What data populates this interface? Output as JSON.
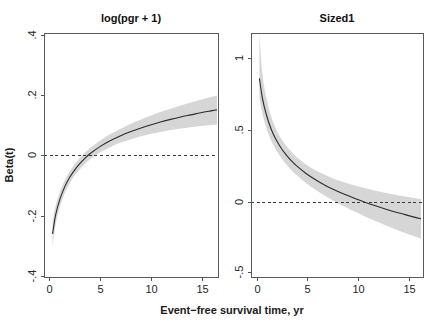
{
  "figure": {
    "xlabel": "Event−free survival time, yr",
    "ylabel": "Beta(t)",
    "background": "#ffffff",
    "band_color": "#d6d6d6",
    "line_color": "#2b2b2b",
    "zero_line_color": "#3a3a3a"
  },
  "chart_data": [
    {
      "type": "line",
      "title": "log(pgr + 1)",
      "xlabel": "Event−free survival time, yr",
      "ylabel": "Beta(t)",
      "xlim": [
        -0.55,
        16.8
      ],
      "ylim": [
        -0.46,
        0.455
      ],
      "xticks": [
        0,
        5,
        10,
        15
      ],
      "xticklabels": [
        "0",
        "5",
        "10",
        "15"
      ],
      "yticks": [
        0.4,
        0.2,
        0,
        -0.2,
        -0.4
      ],
      "yticklabels": [
        ".4",
        ".2",
        "0",
        "-.2",
        "-.4"
      ],
      "grid": false,
      "legend": null,
      "reference_line": {
        "y": 0,
        "style": "dashed"
      },
      "x": [
        0.3,
        0.6,
        1.0,
        1.5,
        2.0,
        2.5,
        3.0,
        3.5,
        4.0,
        5.0,
        6.0,
        7.0,
        8.0,
        9.0,
        10.0,
        11.0,
        12.0,
        13.0,
        14.0,
        15.0,
        16.0,
        16.6
      ],
      "series": [
        {
          "name": "fit",
          "values": [
            -0.298,
            -0.228,
            -0.172,
            -0.122,
            -0.086,
            -0.058,
            -0.035,
            -0.015,
            0.002,
            0.029,
            0.051,
            0.069,
            0.085,
            0.098,
            0.11,
            0.121,
            0.131,
            0.14,
            0.148,
            0.156,
            0.163,
            0.167
          ]
        },
        {
          "name": "ci_lower",
          "values": [
            -0.345,
            -0.263,
            -0.2,
            -0.146,
            -0.108,
            -0.079,
            -0.056,
            -0.036,
            -0.019,
            0.007,
            0.027,
            0.043,
            0.056,
            0.067,
            0.076,
            0.084,
            0.091,
            0.097,
            0.102,
            0.106,
            0.11,
            0.112
          ]
        },
        {
          "name": "ci_upper",
          "values": [
            -0.251,
            -0.193,
            -0.144,
            -0.098,
            -0.064,
            -0.037,
            -0.014,
            0.006,
            0.023,
            0.051,
            0.075,
            0.095,
            0.114,
            0.13,
            0.145,
            0.159,
            0.171,
            0.183,
            0.194,
            0.205,
            0.215,
            0.221
          ]
        }
      ]
    },
    {
      "type": "line",
      "title": "Sized1",
      "xlabel": "Event−free survival time, yr",
      "ylabel": "Beta(t)",
      "xlim": [
        -0.55,
        16.8
      ],
      "ylim": [
        -0.62,
        1.18
      ],
      "xticks": [
        0,
        5,
        10,
        15
      ],
      "xticklabels": [
        "0",
        "5",
        "10",
        "15"
      ],
      "yticks": [
        1,
        0.5,
        0,
        -0.5
      ],
      "yticklabels": [
        "1",
        ".5",
        "0",
        "-.5"
      ],
      "grid": false,
      "legend": null,
      "reference_line": {
        "y": 0,
        "style": "dashed"
      },
      "x": [
        0.3,
        0.6,
        1.0,
        1.5,
        2.0,
        2.5,
        3.0,
        3.5,
        4.0,
        5.0,
        6.0,
        7.0,
        8.0,
        9.0,
        10.0,
        11.0,
        12.0,
        13.0,
        14.0,
        15.0,
        16.0,
        16.6
      ],
      "series": [
        {
          "name": "fit",
          "values": [
            0.845,
            0.7,
            0.577,
            0.468,
            0.39,
            0.33,
            0.281,
            0.239,
            0.203,
            0.144,
            0.096,
            0.054,
            0.018,
            -0.014,
            -0.043,
            -0.07,
            -0.095,
            -0.118,
            -0.14,
            -0.16,
            -0.18,
            -0.191
          ]
        },
        {
          "name": "ci_lower",
          "values": [
            0.7,
            0.585,
            0.48,
            0.385,
            0.315,
            0.258,
            0.211,
            0.17,
            0.135,
            0.074,
            0.022,
            -0.024,
            -0.066,
            -0.105,
            -0.141,
            -0.175,
            -0.207,
            -0.238,
            -0.267,
            -0.295,
            -0.322,
            -0.338
          ]
        },
        {
          "name": "ci_upper",
          "values": [
            1.18,
            0.88,
            0.7,
            0.56,
            0.468,
            0.4,
            0.348,
            0.305,
            0.268,
            0.21,
            0.166,
            0.13,
            0.1,
            0.075,
            0.053,
            0.034,
            0.017,
            0.001,
            -0.013,
            -0.027,
            -0.039,
            -0.046
          ]
        }
      ]
    }
  ],
  "panels": [
    {
      "id": "left",
      "title": "log(pgr + 1)",
      "xticklabels": [
        "0",
        "5",
        "10",
        "15"
      ],
      "yticklabels": [
        ".4",
        ".2",
        "0",
        "-.2",
        "-.4"
      ]
    },
    {
      "id": "right",
      "title": "Sized1",
      "xticklabels": [
        "0",
        "5",
        "10",
        "15"
      ],
      "yticklabels": [
        "1",
        ".5",
        "0",
        "-.5"
      ]
    }
  ]
}
